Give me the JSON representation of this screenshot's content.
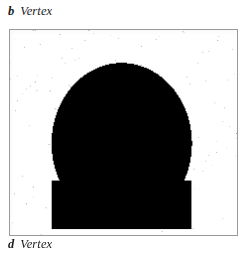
{
  "figure": {
    "caption_top": {
      "marker": "b",
      "label": "Vertex"
    },
    "caption_bottom": {
      "marker": "d",
      "label": "Vertex"
    },
    "plate": {
      "modality_name": "brain-scintigram",
      "view": "Vertex",
      "frame_border_color": "#9a9a9a",
      "background_color": "#ffffff",
      "ink_color": "#000000"
    }
  },
  "chart_data": {
    "type": "heatmap",
    "title": "Vertex",
    "xlabel": "",
    "ylabel": "",
    "grid": false,
    "legend": "none",
    "colormap": "grayscale-inverted",
    "value_range": [
      0,
      100
    ],
    "field": {
      "center_x_pct": 49,
      "center_y_pct": 55,
      "radius_x_pct": 26,
      "radius_y_pct": 33,
      "midline_x_pct": 49,
      "midline_intensity": 100,
      "hemisphere_intensity": 72,
      "scatter_intensity": 26,
      "scatter_top_pct": 80,
      "scatter_bottom_pct": 97
    },
    "regions": [
      {
        "name": "superior-sagittal-sinus",
        "x_pct": 49,
        "y_pct": 55,
        "intensity": 100
      },
      {
        "name": "left-hemisphere",
        "x_pct": 36,
        "y_pct": 55,
        "intensity": 74
      },
      {
        "name": "right-hemisphere",
        "x_pct": 62,
        "y_pct": 55,
        "intensity": 70
      },
      {
        "name": "vertex-crown",
        "x_pct": 49,
        "y_pct": 26,
        "intensity": 80
      },
      {
        "name": "occipital-base",
        "x_pct": 49,
        "y_pct": 76,
        "intensity": 88
      },
      {
        "name": "facial-scatter",
        "x_pct": 47,
        "y_pct": 88,
        "intensity": 28
      }
    ]
  }
}
